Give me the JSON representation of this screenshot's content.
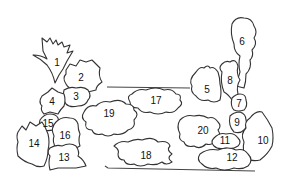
{
  "diagram": {
    "type": "planting-plan",
    "colors": {
      "stroke": "#333333",
      "background": "#ffffff",
      "text": "#111111"
    },
    "labels": [
      {
        "id": "1",
        "x": 57,
        "y": 63
      },
      {
        "id": "2",
        "x": 81,
        "y": 78
      },
      {
        "id": "3",
        "x": 76,
        "y": 97
      },
      {
        "id": "4",
        "x": 52,
        "y": 102
      },
      {
        "id": "5",
        "x": 207,
        "y": 90
      },
      {
        "id": "6",
        "x": 242,
        "y": 42
      },
      {
        "id": "7",
        "x": 239,
        "y": 104
      },
      {
        "id": "8",
        "x": 230,
        "y": 81
      },
      {
        "id": "9",
        "x": 237,
        "y": 123
      },
      {
        "id": "10",
        "x": 263,
        "y": 141
      },
      {
        "id": "11",
        "x": 225,
        "y": 141
      },
      {
        "id": "12",
        "x": 232,
        "y": 158
      },
      {
        "id": "13",
        "x": 64,
        "y": 158
      },
      {
        "id": "14",
        "x": 34,
        "y": 144
      },
      {
        "id": "15",
        "x": 48,
        "y": 124
      },
      {
        "id": "16",
        "x": 65,
        "y": 136
      },
      {
        "id": "17",
        "x": 156,
        "y": 101
      },
      {
        "id": "18",
        "x": 146,
        "y": 156
      },
      {
        "id": "19",
        "x": 109,
        "y": 114
      },
      {
        "id": "20",
        "x": 203,
        "y": 131
      }
    ]
  }
}
